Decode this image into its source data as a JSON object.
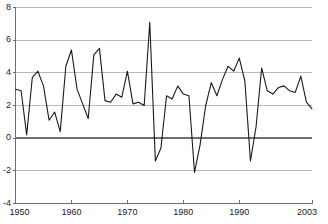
{
  "chart_data": {
    "type": "line",
    "title": "",
    "subtitle": "",
    "xlabel": "",
    "ylabel": "",
    "xlim": [
      1950,
      2003
    ],
    "ylim": [
      -4,
      8
    ],
    "grid": true,
    "legend": "none",
    "x_ticks": [
      "1950",
      "1960",
      "1970",
      "1980",
      "1990",
      "2003"
    ],
    "x_tick_values": [
      1950,
      1960,
      1970,
      1980,
      1990,
      2003
    ],
    "y_ticks": [
      "8",
      "6",
      "4",
      "2",
      "0",
      "-2",
      "-4"
    ],
    "y_tick_values": [
      8,
      6,
      4,
      2,
      0,
      -2,
      -4
    ],
    "zero_line": 0,
    "line_color": "#1a1a1a",
    "grid_color": "#b9b9b9",
    "axis_color": "#7a7a7a",
    "series": [
      {
        "name": "annual-rate",
        "x": [
          1950,
          1951,
          1952,
          1953,
          1954,
          1955,
          1956,
          1957,
          1958,
          1959,
          1960,
          1961,
          1962,
          1963,
          1964,
          1965,
          1966,
          1967,
          1968,
          1969,
          1970,
          1971,
          1972,
          1973,
          1974,
          1975,
          1976,
          1977,
          1978,
          1979,
          1980,
          1981,
          1982,
          1983,
          1984,
          1985,
          1986,
          1987,
          1988,
          1989,
          1990,
          1991,
          1992,
          1993,
          1994,
          1995,
          1996,
          1997,
          1998,
          1999,
          2000,
          2001,
          2002,
          2003
        ],
        "values": [
          3.0,
          2.9,
          0.2,
          3.7,
          4.1,
          3.2,
          1.1,
          1.6,
          0.4,
          4.4,
          5.4,
          3.0,
          2.1,
          1.2,
          5.1,
          5.5,
          2.3,
          2.2,
          2.7,
          2.5,
          4.1,
          2.1,
          2.2,
          2.0,
          7.1,
          -1.4,
          -0.6,
          2.6,
          2.4,
          3.2,
          2.7,
          2.6,
          -2.1,
          -0.4,
          2.0,
          3.4,
          2.6,
          3.6,
          4.4,
          4.1,
          4.9,
          3.5,
          -1.4,
          0.7,
          4.3,
          2.9,
          2.7,
          3.1,
          3.2,
          2.9,
          2.8,
          3.8,
          2.2,
          1.8
        ]
      }
    ]
  }
}
